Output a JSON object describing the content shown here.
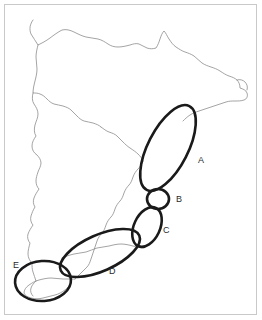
{
  "figure": {
    "kind": "annotated-coastline-map",
    "width": 262,
    "height": 320,
    "background_color": "#ffffff",
    "frame_color": "#c9c9c9",
    "coastline_color": "#8d8d8d",
    "annotation_color": "#1a1a1a",
    "label_color": "#2b2b2b"
  },
  "regions": [
    {
      "id": "A",
      "label": "A",
      "shape": "ellipse",
      "label_x": 198,
      "label_y": 163,
      "cx": 168,
      "cy": 148,
      "rx": 20,
      "ry": 47,
      "rotation": 27
    },
    {
      "id": "B",
      "label": "B",
      "shape": "circle",
      "label_x": 176,
      "label_y": 202,
      "cx": 158,
      "cy": 199,
      "rx": 11,
      "ry": 10,
      "rotation": 0
    },
    {
      "id": "C",
      "label": "C",
      "shape": "ellipse",
      "label_x": 163,
      "label_y": 233,
      "cx": 147,
      "cy": 227,
      "rx": 13,
      "ry": 21,
      "rotation": 25
    },
    {
      "id": "D",
      "label": "D",
      "shape": "ellipse",
      "label_x": 109,
      "label_y": 274,
      "cx": 100,
      "cy": 253,
      "rx": 43,
      "ry": 18,
      "rotation": -24
    },
    {
      "id": "E",
      "label": "E",
      "shape": "ellipse",
      "label_x": 13,
      "label_y": 268,
      "cx": 43,
      "cy": 281,
      "rx": 28,
      "ry": 20,
      "rotation": -4
    }
  ],
  "coastline_paths": {
    "outline": "M 33 22 C 31 26 31 31 33 35 C 35 39 37 42 38 46 C 36 50 34 53 33 57 C 32 62 33 66 34 70 C 35 74 36 78 36 82 C 36 86 34 90 33 94 C 33 99 35 103 37 106 C 38 110 38 114 37 118 C 36 122 34 125 33 129 C 32 133 33 137 35 140 C 33 143 31 146 31 150 C 31 154 33 157 36 159 C 38 162 39 165 38 169 C 37 173 35 176 34 180 C 33 184 34 188 36 191 C 35 195 33 198 32 202 C 31 206 32 210 34 213 C 33 217 31 220 30 224 C 29 228 30 232 32 235 C 30 238 28 241 27 245 C 26 249 27 253 29 256 C 28 260 27 263 27 267 C 27 271 29 274 31 276",
    "inner_left": "M 38 46 C 43 44 48 42 52 39 C 56 36 59 33 62 30",
    "north_coast": "M 33 22 C 37 21 41 22 44 24 C 48 27 51 31 55 34 C 60 37 65 39 70 41 C 75 43 80 45 85 46 C 90 47 95 46 100 45 C 105 44 110 44 115 45 C 120 46 124 48 129 49 C 134 50 139 49 143 47 C 147 45 150 42 153 39 C 156 36 159 33 162 31 C 165 33 167 36 169 39 C 172 43 175 46 179 49 C 183 52 187 54 191 56 C 195 58 198 61 201 64 C 204 67 207 70 211 72 C 215 74 219 75 223 76 C 227 77 231 78 234 80 C 237 82 239 85 240 88 C 241 91 241 94 240 97 C 238 99 235 100 232 100 C 229 100 226 100 223 101 C 220 102 217 103 214 105 C 211 107 208 109 205 110 C 202 111 199 112 196 113 C 193 114 190 115 187 117",
    "mid_left_detail": "M 33 94 C 37 92 41 92 45 93 C 49 94 52 96 55 99 C 58 102 60 105 63 107 C 66 109 69 110 72 110 C 75 110 78 109 81 108 C 84 107 87 107 90 108 C 93 109 95 111 97 113",
    "east_edge": "M 97 113 C 100 115 103 117 106 119 C 109 121 112 124 114 127 C 116 130 118 133 121 135 C 124 137 127 139 130 141 C 133 143 136 146 138 149 C 140 152 142 155 144 158 C 146 161 148 164 150 167 C 152 170 154 173 155 176 C 156 179 157 182 157 185",
    "lower_inland": "M 157 185 C 156 188 154 191 152 193 C 150 195 148 198 147 201 C 146 204 145 207 144 210 C 143 213 141 216 139 218 C 137 220 135 223 134 226 C 133 229 132 232 130 234 C 128 236 126 238 123 240 C 120 242 117 243 114 244 C 111 245 108 246 105 247 C 102 248 99 249 96 251 C 93 253 90 255 87 256 C 84 257 81 258 78 259 C 75 260 72 261 69 263 C 66 265 63 267 60 268",
    "peninsula_west": "M 60 268 C 57 269 54 270 51 271 C 48 272 45 273 42 275 C 39 277 37 279 36 282 C 35 285 35 288 36 291 C 37 294 39 296 42 298 C 45 300 48 301 51 301 C 54 301 57 300 60 299 C 63 298 66 296 68 294 C 70 292 72 290 73 287",
    "right_notch": "M 240 88 C 243 89 246 90 248 92 C 250 94 251 96 250 99 C 249 101 247 102 244 102"
  }
}
